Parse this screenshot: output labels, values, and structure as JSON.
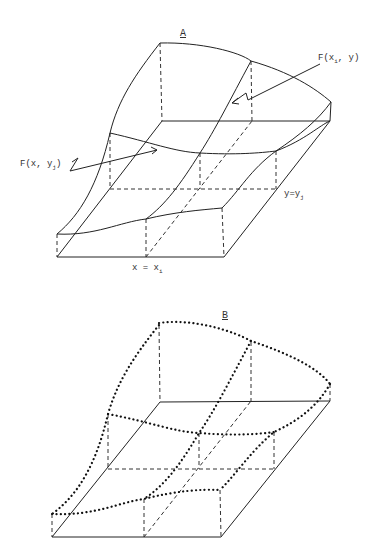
{
  "figure": {
    "panels": [
      {
        "id": "A",
        "title": "A",
        "style": "solid surface curves",
        "labels": {
          "f_xi_y": {
            "main": "F(x",
            "sub": "i",
            "tail": ", y)"
          },
          "f_x_yj": {
            "main": "F(x, y",
            "sub": "j",
            "tail": ")"
          },
          "y_eq_yj": {
            "main": "y=y",
            "sub": "j"
          },
          "x_eq_xi": {
            "main": "x = x",
            "sub": "i"
          }
        }
      },
      {
        "id": "B",
        "title": "B",
        "style": "dotted surface curves"
      }
    ],
    "colors": {
      "line": "#222222",
      "background": "#ffffff"
    }
  }
}
